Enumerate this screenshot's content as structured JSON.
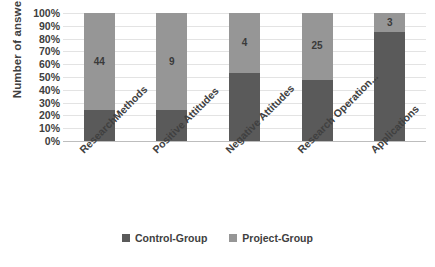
{
  "chart_data": {
    "type": "bar",
    "subtype": "stacked-100-percent",
    "title": "",
    "xlabel": "",
    "ylabel": "Number of answers",
    "ylim": [
      0,
      100
    ],
    "ytick_labels": [
      "100%",
      "90%",
      "80%",
      "70%",
      "60%",
      "50%",
      "40%",
      "30%",
      "20%",
      "10%",
      "0%"
    ],
    "ytick_values": [
      100,
      90,
      80,
      70,
      60,
      50,
      40,
      30,
      20,
      10,
      0
    ],
    "grid": true,
    "legend_position": "bottom",
    "categories": [
      "ResearchMethods",
      "Positive Attitudes",
      "Negative Attitudes",
      "Research Operation...",
      "Applications"
    ],
    "series": [
      {
        "name": "Control-Group",
        "color": "#5a5a5a",
        "values": [
          24,
          24,
          53,
          48,
          85
        ],
        "data_labels": [
          "",
          "",
          "",
          "",
          ""
        ]
      },
      {
        "name": "Project-Group",
        "color": "#969696",
        "values": [
          76,
          76,
          47,
          52,
          15
        ],
        "data_labels": [
          "44",
          "9",
          "4",
          "25",
          "3"
        ]
      }
    ]
  },
  "colors": {
    "control_group": "#5a5a5a",
    "project_group": "#969696",
    "gridline": "#e3e3e3",
    "axis": "#bdbdbd",
    "text": "#404040",
    "background": "#ffffff"
  },
  "legend": {
    "items": [
      {
        "label": "Control-Group",
        "color": "#5a5a5a"
      },
      {
        "label": "Project-Group",
        "color": "#969696"
      }
    ]
  }
}
